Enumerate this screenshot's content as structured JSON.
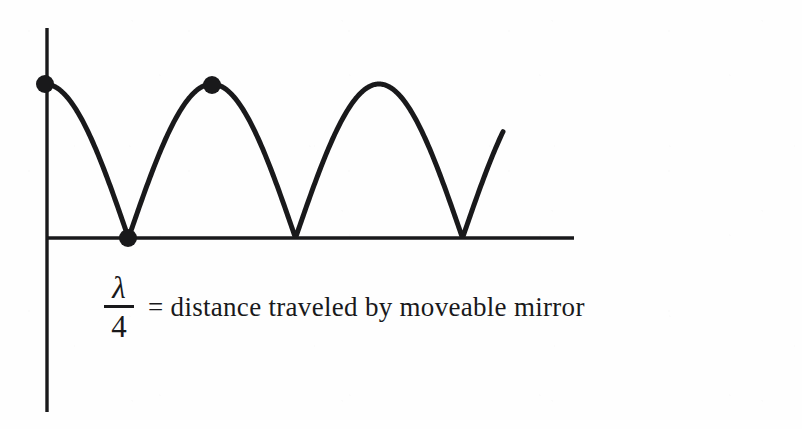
{
  "figure": {
    "background_color": "#fefefe",
    "ink_color": "#19191b",
    "width": 802,
    "height": 429
  },
  "caption": {
    "fraction": {
      "numerator": "λ",
      "denominator": "4"
    },
    "text": "= distance traveled by moveable mirror"
  },
  "chart_data": {
    "type": "line",
    "title": "",
    "subtitle": "",
    "xlabel": "",
    "ylabel": "",
    "grid": false,
    "legend": false,
    "annotations": [
      "λ/4 = distance traveled by moveable mirror"
    ],
    "axes": {
      "y_axis": {
        "x": 47,
        "y_top": 28,
        "y_bottom": 412,
        "color": "#19191b",
        "width": 3
      },
      "x_axis": {
        "y": 238,
        "x_left": 47,
        "x_right": 574,
        "color": "#19191b",
        "width": 3
      }
    },
    "curve": {
      "description": "rectified cosine (interference fringe intensity) starting at a maximum on the y-axis",
      "shape": "abs-cosine",
      "color": "#19191b",
      "stroke_width": 5,
      "amplitude": 154,
      "baseline_y": 238,
      "peak_y": 84,
      "period_px": 167,
      "x_start": 45,
      "x_end": 503,
      "maxima_x": [
        45,
        212,
        379
      ],
      "minima_x": [
        128,
        295,
        462
      ]
    },
    "markers": [
      {
        "label": "start-maximum",
        "x": 45,
        "y": 84,
        "radius": 9
      },
      {
        "label": "first-minimum",
        "x": 128,
        "y": 238,
        "radius": 9
      },
      {
        "label": "second-maximum",
        "x": 212,
        "y": 85,
        "radius": 9
      }
    ]
  }
}
